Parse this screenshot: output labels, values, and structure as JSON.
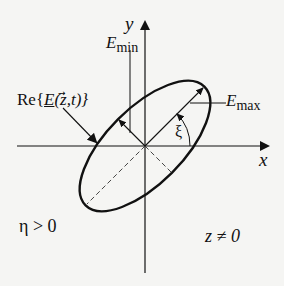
{
  "diagram": {
    "axes": {
      "x_label": "x",
      "y_label": "y"
    },
    "labels": {
      "e_min_base": "E",
      "e_min_sub": "min",
      "e_max_base": "E",
      "e_max_sub": "max",
      "field_re": "Re{",
      "field_vec": "E",
      "field_args": "(z,t)}",
      "angle": "ξ",
      "eta_condition": "η > 0",
      "z_condition": "z ≠ 0"
    },
    "geometry": {
      "origin": [
        145,
        146
      ],
      "ellipse_rx": 84,
      "ellipse_ry": 38,
      "ellipse_rotation_deg": -45,
      "stroke_color": "#111111",
      "background": "#f5f5f3"
    }
  }
}
